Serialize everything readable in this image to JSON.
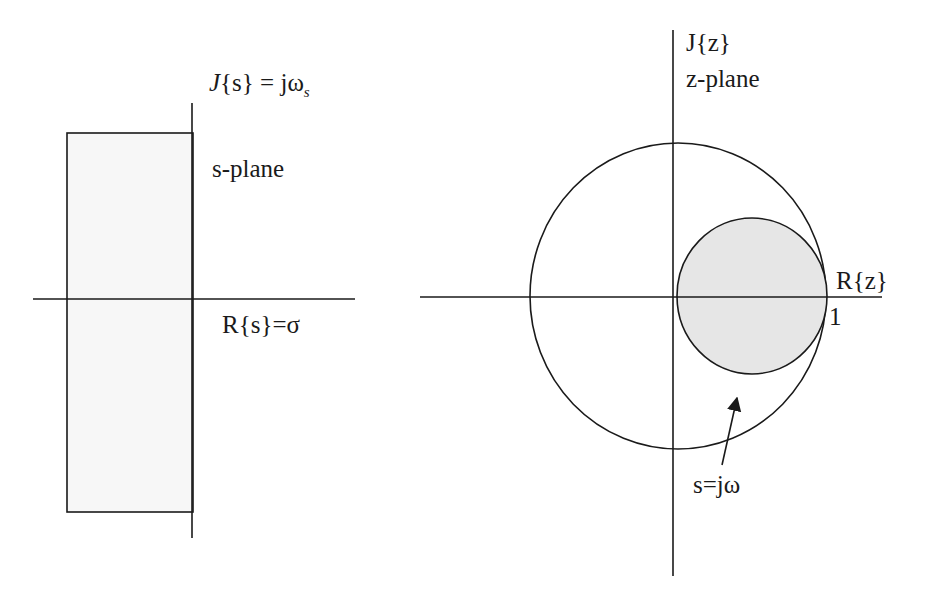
{
  "colors": {
    "stroke": "#1a1a1a",
    "shade_fill": "#e6e6e6",
    "strip_fill": "#f7f7f7",
    "background": "#ffffff"
  },
  "s_plane": {
    "imag_axis_label_J": "J",
    "imag_axis_label_rest": "{s} = jω",
    "imag_axis_label_sub": "s",
    "plane_label": "s-plane",
    "real_axis_label": "R{s}=σ",
    "strip": {
      "x": 67,
      "y": 133,
      "width": 126,
      "height": 379
    },
    "imag_axis": {
      "x": 192,
      "y1": 103,
      "y2": 538
    },
    "real_axis": {
      "y": 299,
      "x1": 33,
      "x2": 355
    }
  },
  "z_plane": {
    "imag_axis_label": "J{z}",
    "plane_label": "z-plane",
    "real_axis_label": "R{z}",
    "unit_marker_label": "1",
    "mapping_label": "s=jω",
    "imag_axis": {
      "x": 673,
      "y1": 30,
      "y2": 576
    },
    "real_axis": {
      "y": 297,
      "x1": 420,
      "x2": 882
    },
    "unit_circle": {
      "cx": 678,
      "cy": 296,
      "rx": 148,
      "ry": 153
    },
    "image_circle": {
      "cx": 752,
      "cy": 296,
      "rx": 75,
      "ry": 78
    },
    "arrow": {
      "x1": 722,
      "y1": 465,
      "x2": 737,
      "y2": 398
    }
  }
}
